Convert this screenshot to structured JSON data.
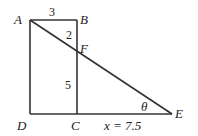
{
  "diagram": {
    "points": {
      "A": {
        "label": "A",
        "x": 30,
        "y": 20
      },
      "B": {
        "label": "B",
        "x": 77,
        "y": 20
      },
      "F": {
        "label": "F",
        "x": 77,
        "y": 49
      },
      "C": {
        "label": "C",
        "x": 77,
        "y": 114
      },
      "D": {
        "label": "D",
        "x": 30,
        "y": 114
      },
      "E": {
        "label": "E",
        "x": 172,
        "y": 114
      }
    },
    "measures": {
      "AB": "3",
      "BF": "2",
      "FC": "5",
      "CE": "x = 7.5"
    },
    "angle_label": "θ",
    "stroke_color": "#333333"
  }
}
